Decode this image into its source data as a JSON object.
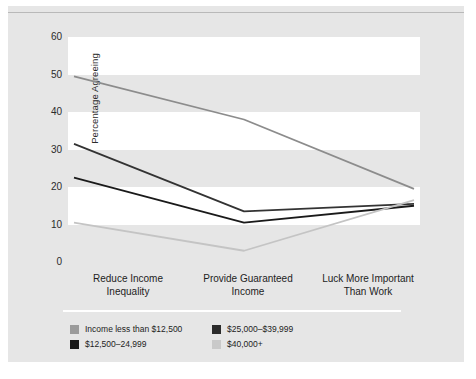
{
  "chart_data": {
    "type": "line",
    "title": "",
    "xlabel": "",
    "ylabel": "Percentage Agreeing",
    "categories": [
      "Reduce Income Inequality",
      "Provide Guaranteed Income",
      "Luck More Important Than Work"
    ],
    "category_lines": [
      [
        "Reduce Income",
        "Inequality"
      ],
      [
        "Provide Guaranteed",
        "Income"
      ],
      [
        "Luck More Important",
        "Than Work"
      ]
    ],
    "ylim": [
      0,
      60
    ],
    "yticks": [
      0,
      10,
      20,
      30,
      40,
      50,
      60
    ],
    "ytick_labels": [
      "0",
      "10",
      "20",
      "30",
      "40",
      "50",
      "60"
    ],
    "grid": "alternating-horizontal-bands",
    "legend_position": "below",
    "series": [
      {
        "name": "Income less than $12,500",
        "color": "#8c8c8c",
        "values": [
          49.5,
          38.0,
          19.5
        ]
      },
      {
        "name": "$12,500–24,999",
        "color": "#1a1a1a",
        "values": [
          22.5,
          10.5,
          15.0
        ]
      },
      {
        "name": "$25,000–$39,999",
        "color": "#333333",
        "values": [
          31.5,
          13.5,
          15.5
        ]
      },
      {
        "name": "$40,000+",
        "color": "#c4c4c4",
        "values": [
          10.5,
          3.0,
          16.5
        ]
      }
    ]
  },
  "legend": {
    "items": [
      {
        "label": "Income less than $12,500",
        "color": "#9b9b9b"
      },
      {
        "label": "$25,000–$39,999",
        "color": "#2b2b2b"
      },
      {
        "label": "$12,500–24,999",
        "color": "#1a1a1a"
      },
      {
        "label": "$40,000+",
        "color": "#c9c9c9"
      }
    ]
  },
  "colors": {
    "panel_background": "#e6e6e6",
    "band_background": "#ffffff",
    "text": "#1d1d1d",
    "top_rule": "#b9b9b9"
  }
}
